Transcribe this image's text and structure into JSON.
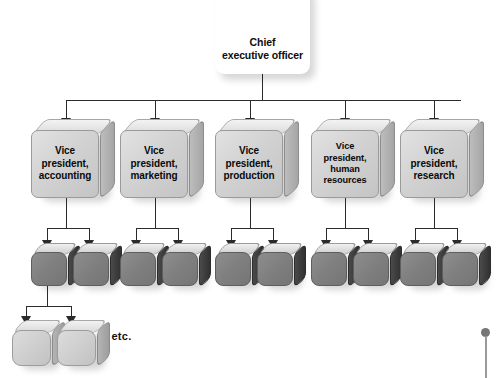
{
  "diagram": {
    "background_color": "#ffffff",
    "line_color": "#2b2b2b",
    "ceo": {
      "label": "Chief\nexecutive officer",
      "line1": "Chief",
      "line2": "executive officer",
      "fill_color": "#ffffff"
    },
    "vice_presidents": [
      {
        "line1": "Vice",
        "line2": "president,",
        "line3": "accounting",
        "subordinate_count": 2
      },
      {
        "line1": "Vice",
        "line2": "president,",
        "line3": "marketing",
        "subordinate_count": 2
      },
      {
        "line1": "Vice",
        "line2": "president,",
        "line3": "production",
        "subordinate_count": 2
      },
      {
        "line1": "Vice",
        "line2": "president,",
        "line3": "human",
        "line4": "resources",
        "subordinate_count": 2
      },
      {
        "line1": "Vice",
        "line2": "president,",
        "line3": "research",
        "subordinate_count": 2
      }
    ],
    "middle_row": {
      "count": 10,
      "label": "",
      "fill_color": "#7f7f7f"
    },
    "bottom_row": {
      "count": 2,
      "label": "",
      "fill_color": "#cfcfcf"
    },
    "etc_note": "... etc.",
    "pin": {
      "icon": "pin-icon",
      "color": "#767676"
    }
  }
}
